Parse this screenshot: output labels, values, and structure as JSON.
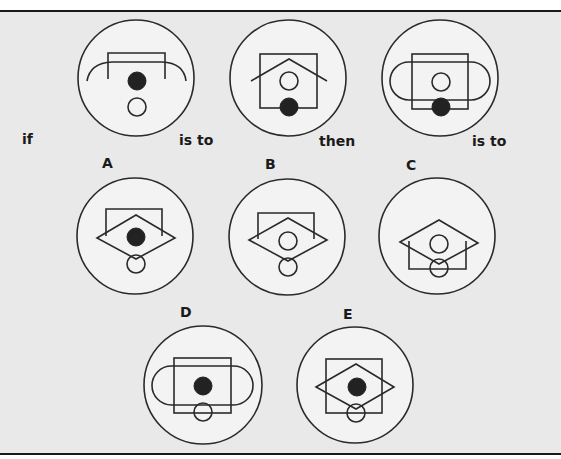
{
  "puzzle": {
    "words": {
      "if": "if",
      "is_to_1": "is to",
      "then": "then",
      "is_to_2": "is to"
    },
    "options": {
      "A": "A",
      "B": "B",
      "C": "C",
      "D": "D",
      "E": "E"
    },
    "figures": [
      {
        "id": "example-1",
        "elements": [
          "outer-circle",
          "square-bracket",
          "arc",
          "filled-dot",
          "hollow-circle"
        ]
      },
      {
        "id": "example-2",
        "elements": [
          "outer-circle",
          "square",
          "roof-chevron",
          "hollow-circle",
          "filled-dot"
        ]
      },
      {
        "id": "example-3",
        "elements": [
          "outer-circle",
          "square",
          "stadium",
          "hollow-circle",
          "filled-dot"
        ]
      },
      {
        "id": "option-A",
        "elements": [
          "outer-circle",
          "square-bracket",
          "diamond",
          "filled-dot",
          "hollow-circle"
        ]
      },
      {
        "id": "option-B",
        "elements": [
          "outer-circle",
          "square-bracket",
          "diamond",
          "hollow-circle",
          "hollow-circle"
        ]
      },
      {
        "id": "option-C",
        "elements": [
          "outer-circle",
          "u-bracket",
          "diamond",
          "hollow-circle",
          "hollow-circle"
        ]
      },
      {
        "id": "option-D",
        "elements": [
          "outer-circle",
          "square",
          "stadium",
          "filled-dot",
          "hollow-circle"
        ]
      },
      {
        "id": "option-E",
        "elements": [
          "outer-circle",
          "square",
          "diamond",
          "filled-dot",
          "hollow-circle"
        ]
      }
    ]
  }
}
